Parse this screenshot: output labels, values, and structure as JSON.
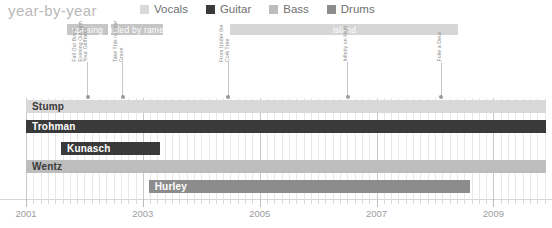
{
  "header": {
    "title": "year-by-year",
    "legend": [
      {
        "label": "Vocals",
        "color": "#d9d9d9"
      },
      {
        "label": "Guitar",
        "color": "#3a3a3a"
      },
      {
        "label": "Bass",
        "color": "#bdbdbd"
      },
      {
        "label": "Drums",
        "color": "#8c8c8c"
      }
    ]
  },
  "chart_data": {
    "type": "bar",
    "title": "year-by-year",
    "xlabel": "",
    "ylabel": "",
    "xlim": [
      2001.0,
      2009.9
    ],
    "grid": true,
    "legend_position": "top",
    "categories": [
      "Stump",
      "Trohman",
      "Kunasch",
      "Wentz",
      "Hurley"
    ],
    "series": [
      {
        "name": "Stump",
        "role": "Vocals",
        "color": "#d9d9d9",
        "start": 2001.0,
        "end": 2009.9
      },
      {
        "name": "Trohman",
        "role": "Guitar",
        "color": "#3a3a3a",
        "start": 2001.0,
        "end": 2009.9
      },
      {
        "name": "Kunasch",
        "role": "Guitar",
        "color": "#3a3a3a",
        "start": 2001.6,
        "end": 2003.3
      },
      {
        "name": "Wentz",
        "role": "Bass",
        "color": "#bdbdbd",
        "start": 2001.0,
        "end": 2009.9
      },
      {
        "name": "Hurley",
        "role": "Drums",
        "color": "#8c8c8c",
        "start": 2003.1,
        "end": 2008.6
      }
    ],
    "label_bands": [
      {
        "label": "uprising",
        "start": 2001.7,
        "end": 2002.4,
        "color": "#c6c6c6"
      },
      {
        "label": "fueled by ramen",
        "start": 2002.45,
        "end": 2003.35,
        "color": "#c6c6c6"
      },
      {
        "label": "island",
        "start": 2004.5,
        "end": 2008.4,
        "color": "#d6d6d6"
      }
    ],
    "album_markers": [
      {
        "lines": [
          "Fall Out Boy's",
          "Evening Out with",
          "Your Girlfriend"
        ],
        "x": 2002.05
      },
      {
        "lines": [
          "Take This to Your",
          "Grave"
        ],
        "x": 2002.65
      },
      {
        "lines": [
          "From Under the",
          "Cork Tree"
        ],
        "x": 2004.45
      },
      {
        "lines": [
          "Infinity on High"
        ],
        "x": 2006.5
      },
      {
        "lines": [
          "Folie a Deux"
        ],
        "x": 2008.1
      }
    ],
    "xticks": [
      2001,
      2003,
      2005,
      2007,
      2009
    ],
    "xtick_labels": [
      "2001",
      "2003",
      "2005",
      "2007",
      "2009"
    ],
    "minor_tick_step": 0.125
  }
}
